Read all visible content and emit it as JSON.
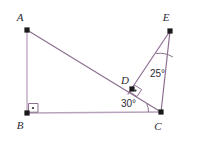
{
  "figure": {
    "background_color": "#ffffff",
    "stroke_color_main": "#8d6f90",
    "stroke_color_light": "#b9a2bd",
    "label_color": "#2b2b33",
    "vertex_dot_color": "#1a1a1a",
    "points": [
      {
        "id": "A",
        "label": "A",
        "x": 27,
        "y": 30,
        "label_x": 20,
        "label_y": 21,
        "dot": true
      },
      {
        "id": "B",
        "label": "B",
        "x": 27,
        "y": 113,
        "label_x": 20,
        "label_y": 129,
        "dot": true
      },
      {
        "id": "C",
        "label": "C",
        "x": 161,
        "y": 112,
        "label_x": 158,
        "label_y": 130,
        "dot": true
      },
      {
        "id": "D",
        "label": "D",
        "x": 132,
        "y": 89,
        "label_x": 125,
        "label_y": 84,
        "dot": true
      },
      {
        "id": "E",
        "label": "E",
        "x": 170,
        "y": 31,
        "label_x": 166,
        "label_y": 21,
        "dot": true
      }
    ],
    "segments": [
      {
        "id": "AB",
        "from": "A",
        "to": "B",
        "x1": 27,
        "y1": 30,
        "x2": 27,
        "y2": 113,
        "color": "#b9a2bd",
        "width": 1.3
      },
      {
        "id": "BC",
        "from": "B",
        "to": "C",
        "x1": 27,
        "y1": 113,
        "x2": 161,
        "y2": 112,
        "color": "#b9a2bd",
        "width": 1.3
      },
      {
        "id": "AC",
        "from": "A",
        "to": "C",
        "x1": 27,
        "y1": 30,
        "x2": 161,
        "y2": 112,
        "color": "#8d6f90",
        "width": 1.2
      },
      {
        "id": "EC",
        "from": "E",
        "to": "C",
        "x1": 170,
        "y1": 31,
        "x2": 161,
        "y2": 112,
        "color": "#8d6f90",
        "width": 1.2
      },
      {
        "id": "ED",
        "from": "E",
        "to": "D",
        "x1": 170,
        "y1": 31,
        "x2": 128,
        "y2": 94,
        "color": "#8d6f90",
        "width": 1.2
      }
    ],
    "right_angles": [
      {
        "id": "right-angle-B",
        "at": "B",
        "d": "M 28.5 103.5 L 38 103.5 L 38 112.2 L 28.5 112.2 Z",
        "dot_x": 33,
        "dot_y": 108
      },
      {
        "id": "right-angle-D",
        "at": "D",
        "d": "M 134.2 84.8 L 141.6 89.6 L 137.0 96.6 L 129.6 91.8 Z",
        "dot_x": 135.5,
        "dot_y": 90.6
      }
    ],
    "angle_marks": [
      {
        "id": "angle-30-at-C",
        "value": "30°",
        "vertex": "C",
        "arc_d": "M 146.7 103.7 A 18 18 0 0 1 148.5 112.1",
        "label_x": 121,
        "label_y": 107
      },
      {
        "id": "angle-25-at-E",
        "value": "25°",
        "vertex": "E",
        "arc_d": "M 155.8 53.5 A 26 26 0 0 1 172.9 57.0",
        "label_x": 150,
        "label_y": 77
      }
    ],
    "labels": {
      "A": "A",
      "B": "B",
      "C": "C",
      "D": "D",
      "E": "E",
      "angle_at_C": "30°",
      "angle_at_E": "25°"
    }
  }
}
